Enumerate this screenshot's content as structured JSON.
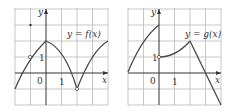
{
  "graphs": [
    {
      "id": "f",
      "label": "y = f(x)",
      "y_axis_label": "y",
      "x_axis_label": "x",
      "origin_label": "0",
      "tick_x_label": "1",
      "tick_y_label": "1"
    },
    {
      "id": "g",
      "label": "y = g(x)",
      "y_axis_label": "y",
      "x_axis_label": "x",
      "origin_label": "0",
      "tick_x_label": "1",
      "tick_y_label": "1"
    }
  ],
  "colors": {
    "grid": "#b9b9b9",
    "curve": "#4a4a4a",
    "axis": "#333333"
  }
}
